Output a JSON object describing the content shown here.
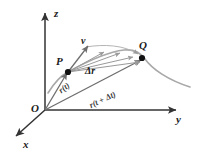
{
  "figure": {
    "kind": "vector-calculus-diagram",
    "background_color": "#ffffff"
  },
  "colors": {
    "axis": "#333333",
    "vector": "#6e6e6e",
    "curve": "#a8a8a8",
    "point": "#111111",
    "label": "#1a1a1a"
  },
  "axes": {
    "z_label": "z",
    "y_label": "y",
    "x_label": "x",
    "origin_label": "O"
  },
  "points": {
    "p_label": "P",
    "q_label": "Q"
  },
  "vectors": {
    "velocity_label": "v",
    "displacement_label": "Δr",
    "position_t_label": "r(t)",
    "position_t_dt_label": "r(t + Δt)"
  }
}
